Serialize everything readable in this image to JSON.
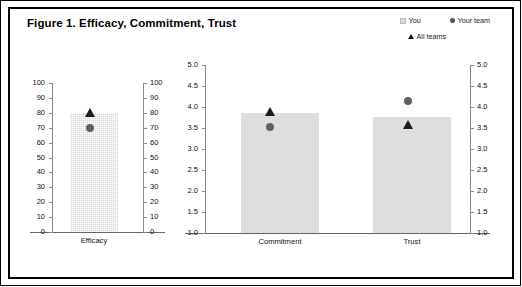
{
  "figure": {
    "title": "Figure 1. Efficacy, Commitment, Trust",
    "background": "#ffffff",
    "border_color": "#000000"
  },
  "legend": {
    "items": [
      {
        "label": "You",
        "marker": "square-icon",
        "color": "#d9d9d9"
      },
      {
        "label": "Your team",
        "marker": "circle-icon",
        "color": "#555555"
      },
      {
        "label": "All teams",
        "marker": "triangle-icon",
        "color": "#111111"
      }
    ]
  },
  "chart_data": [
    {
      "type": "bar",
      "title": "Efficacy",
      "xlabel": "",
      "ylabel": "",
      "categories": [
        "Efficacy"
      ],
      "series": [
        {
          "name": "You",
          "values": [
            80
          ]
        },
        {
          "name": "Your team",
          "values": [
            70
          ]
        },
        {
          "name": "All teams",
          "values": [
            80
          ]
        }
      ],
      "values": [
        80
      ],
      "ylim": [
        0,
        100
      ],
      "yticks": [
        0,
        10,
        20,
        30,
        40,
        50,
        60,
        70,
        80,
        90,
        100
      ],
      "ytick_labels": [
        "0",
        "10",
        "20",
        "30",
        "40",
        "50",
        "60",
        "70",
        "80",
        "90",
        "100"
      ],
      "ytick_labels_right": [
        "0",
        "10",
        "20",
        "30",
        "40",
        "50",
        "60",
        "70",
        "80",
        "90",
        "100"
      ],
      "dual_axis": true,
      "grid": false,
      "legend_position": "top-right"
    },
    {
      "type": "bar",
      "title": "",
      "xlabel": "",
      "ylabel": "",
      "categories": [
        "Commitment",
        "Trust"
      ],
      "series": [
        {
          "name": "You",
          "values": [
            3.85,
            3.75
          ]
        },
        {
          "name": "Your team",
          "values": [
            3.6,
            4.0
          ]
        },
        {
          "name": "All teams",
          "values": [
            3.9,
            3.6
          ]
        }
      ],
      "values": [
        3.85,
        3.75
      ],
      "ylim": [
        1.0,
        5.0
      ],
      "yticks": [
        1.0,
        1.5,
        2.0,
        2.5,
        3.0,
        3.5,
        4.0,
        4.5,
        5.0
      ],
      "ytick_labels": [
        "1.0",
        "1.5",
        "2.0",
        "2.5",
        "3.0",
        "3.5",
        "4.0",
        "4.5",
        "5.0"
      ],
      "ytick_labels_right": [
        "1.0",
        "1.5",
        "2.0",
        "2.5",
        "3.0",
        "3.5",
        "4.0",
        "4.5",
        "5.0"
      ],
      "dual_axis": true,
      "grid": false,
      "legend_position": "top-right"
    }
  ]
}
